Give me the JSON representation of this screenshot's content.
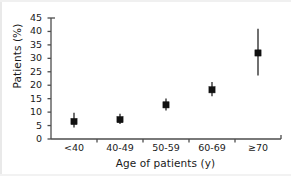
{
  "chart_data": {
    "type": "scatter",
    "title": "",
    "xlabel": "Age of patients (y)",
    "ylabel": "Patients (%)",
    "categories": [
      "<40",
      "40-49",
      "50-59",
      "60-69",
      "≥70"
    ],
    "values": [
      6.5,
      7.2,
      12.7,
      18.3,
      32.0
    ],
    "error_low": [
      4.3,
      5.6,
      10.6,
      15.9,
      23.6
    ],
    "error_high": [
      9.8,
      9.4,
      15.1,
      21.2,
      41.0
    ],
    "ylim": [
      0,
      45
    ],
    "ytick_labels": [
      "0",
      "5",
      "10",
      "15",
      "20",
      "25",
      "30",
      "35",
      "40",
      "45"
    ],
    "ytick_values": [
      0,
      5,
      10,
      15,
      20,
      25,
      30,
      35,
      40,
      45
    ],
    "grid": false,
    "legend": null,
    "marker": "square",
    "marker_color": "#111111",
    "errorbar_color": "#111111",
    "axis_color": "#4d4d4d"
  },
  "figure": {
    "background": "#ffffff"
  }
}
